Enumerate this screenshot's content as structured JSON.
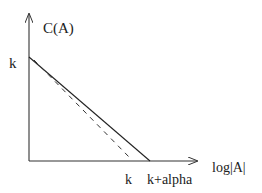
{
  "diagram": {
    "y_axis_label": "C(A)",
    "x_axis_label": "log|A|",
    "y_intercept_label": "k",
    "x_tick_labels": [
      "k",
      "k+alpha"
    ],
    "lines": [
      {
        "name": "solid-line",
        "style": "solid",
        "from_label": "k",
        "to_label": "k+alpha"
      },
      {
        "name": "dashed-line",
        "style": "dashed",
        "from_label": "k",
        "to_label": "k"
      }
    ],
    "colors": {
      "stroke": "#222222",
      "background": "#ffffff"
    }
  }
}
